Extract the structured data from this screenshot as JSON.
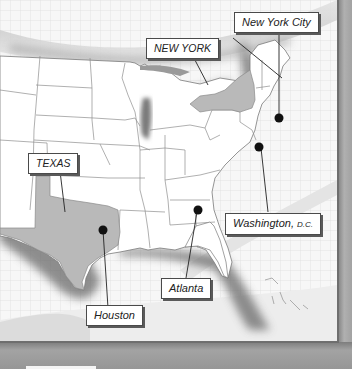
{
  "map": {
    "title": "",
    "region": "Eastern and Central United States",
    "colors": {
      "land": "#ffffff",
      "highlight_state": "#b9b9b9",
      "borders": "#8a8a8a",
      "marker": "#111111",
      "frame": "#9a9a9a",
      "callout_border": "#4a4a4a"
    },
    "highlighted_states": [
      {
        "name": "NEW YORK",
        "label": "NEW YORK"
      },
      {
        "name": "TEXAS",
        "label": "TEXAS"
      }
    ],
    "cities": [
      {
        "name": "New York City",
        "label": "New York City"
      },
      {
        "name": "Washington",
        "label": "Washington,",
        "suffix": "D.C."
      },
      {
        "name": "Atlanta",
        "label": "Atlanta"
      },
      {
        "name": "Houston",
        "label": "Houston"
      }
    ]
  }
}
